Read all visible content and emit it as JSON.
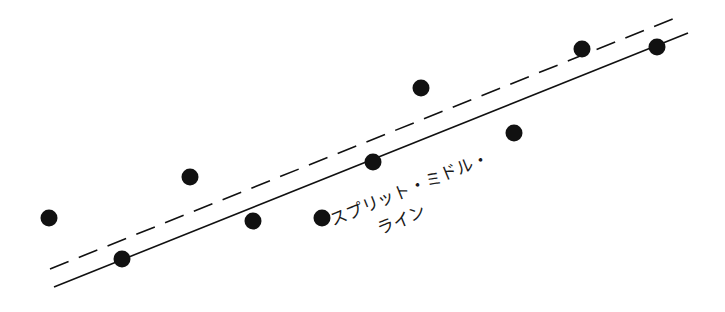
{
  "diagram": {
    "label_line1": "スプリット・ミドル・",
    "label_line2": "ライン",
    "colors": {
      "ink": "#111111",
      "background": "#ffffff"
    },
    "solid_line": {
      "x1": 54,
      "y1": 287,
      "x2": 688,
      "y2": 33
    },
    "dashed_line": {
      "x1": 50,
      "y1": 269,
      "x2": 680,
      "y2": 16
    },
    "points": [
      {
        "x": 49,
        "y": 218
      },
      {
        "x": 122,
        "y": 259
      },
      {
        "x": 190,
        "y": 177
      },
      {
        "x": 253,
        "y": 221
      },
      {
        "x": 322,
        "y": 218
      },
      {
        "x": 373,
        "y": 162
      },
      {
        "x": 421,
        "y": 88
      },
      {
        "x": 514,
        "y": 133
      },
      {
        "x": 582,
        "y": 49
      },
      {
        "x": 657,
        "y": 47
      }
    ]
  }
}
